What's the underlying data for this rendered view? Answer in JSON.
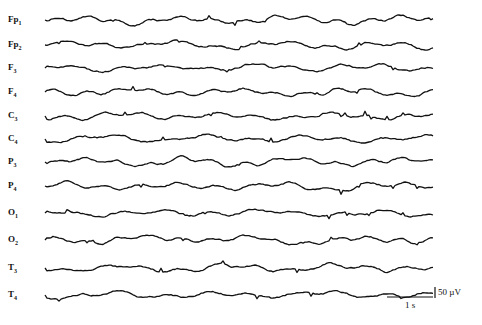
{
  "chart_data": {
    "type": "line",
    "title": "",
    "channels": [
      {
        "name": "Fp1",
        "base": "Fp",
        "sub": "1",
        "baseline_y": 20
      },
      {
        "name": "Fp2",
        "base": "Fp",
        "sub": "2",
        "baseline_y": 45
      },
      {
        "name": "F3",
        "base": "F",
        "sub": "3",
        "baseline_y": 68
      },
      {
        "name": "F4",
        "base": "F",
        "sub": "4",
        "baseline_y": 92
      },
      {
        "name": "C3",
        "base": "C",
        "sub": "3",
        "baseline_y": 116
      },
      {
        "name": "C4",
        "base": "C",
        "sub": "4",
        "baseline_y": 139
      },
      {
        "name": "P3",
        "base": "P",
        "sub": "3",
        "baseline_y": 162
      },
      {
        "name": "P4",
        "base": "P",
        "sub": "4",
        "baseline_y": 186
      },
      {
        "name": "O1",
        "base": "O",
        "sub": "1",
        "baseline_y": 213
      },
      {
        "name": "O2",
        "base": "O",
        "sub": "2",
        "baseline_y": 240
      },
      {
        "name": "T3",
        "base": "T",
        "sub": "3",
        "baseline_y": 268
      },
      {
        "name": "T4",
        "base": "T",
        "sub": "4",
        "baseline_y": 295
      }
    ],
    "x_range_px": [
      45,
      433
    ],
    "scale_bar": {
      "time_label": "1 s",
      "amplitude_label": "50 µV"
    },
    "grid": false,
    "legend": "none"
  },
  "scale": {
    "time_label": "1 s",
    "amplitude_label": "50 µV"
  }
}
